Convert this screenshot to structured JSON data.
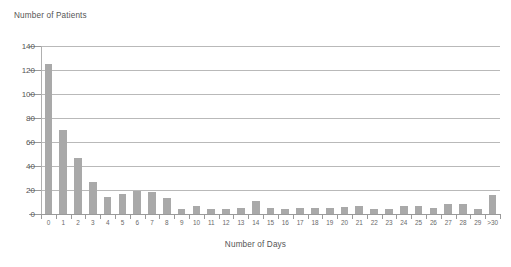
{
  "chart_data": {
    "type": "bar",
    "title": "",
    "ylabel": "Number of Patients",
    "xlabel": "Number of Days",
    "categories": [
      "0",
      "1",
      "2",
      "3",
      "4",
      "5",
      "6",
      "7",
      "8",
      "9",
      "10",
      "11",
      "12",
      "13",
      "14",
      "15",
      "16",
      "17",
      "18",
      "19",
      "20",
      "21",
      "22",
      "23",
      "24",
      "25",
      "26",
      "27",
      "28",
      "29",
      ">30"
    ],
    "values": [
      125,
      70,
      47,
      27,
      14,
      17,
      19,
      18,
      13,
      4,
      7,
      4,
      4,
      5,
      11,
      5,
      4,
      5,
      5,
      5,
      6,
      7,
      4,
      4,
      7,
      7,
      5,
      8,
      8,
      4,
      16
    ],
    "ylim": [
      0,
      140
    ],
    "yticks": [
      0,
      20,
      40,
      60,
      80,
      100,
      120,
      140
    ],
    "ytick_labels": [
      "0",
      "20",
      "40",
      "60",
      "80",
      "100",
      "120",
      "140"
    ],
    "grid": true,
    "legend": "none",
    "bar_color": "#a9a9a9",
    "gridline_color": "#b9b9b9",
    "axis_color": "#9a9a9a",
    "text_color": "#555555"
  }
}
